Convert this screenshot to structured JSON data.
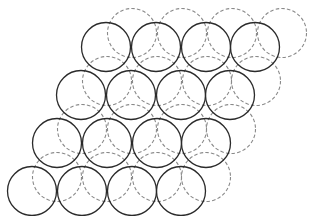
{
  "diagram": {
    "title": "",
    "radius": 24.5,
    "colors": {
      "background": "#ffffff",
      "solid_stroke": "#2a2a2a",
      "dashed_stroke": "#8a8a8a"
    },
    "solid_layer": {
      "name": "layer-a-solid",
      "rows": [
        {
          "y": 47,
          "xs": [
            106,
            156,
            206,
            255
          ]
        },
        {
          "y": 95,
          "xs": [
            81,
            131,
            181,
            230
          ]
        },
        {
          "y": 143,
          "xs": [
            57,
            107,
            157,
            206
          ]
        },
        {
          "y": 191,
          "xs": [
            32,
            82,
            132,
            181
          ]
        }
      ]
    },
    "dashed_layer": {
      "name": "layer-b-dashed",
      "rows": [
        {
          "y": 33,
          "xs": [
            132,
            182,
            232,
            282
          ]
        },
        {
          "y": 81,
          "xs": [
            107,
            157,
            207,
            256
          ]
        },
        {
          "y": 129,
          "xs": [
            82,
            132,
            182,
            231
          ]
        },
        {
          "y": 177,
          "xs": [
            57,
            107,
            157,
            206
          ]
        }
      ]
    }
  }
}
